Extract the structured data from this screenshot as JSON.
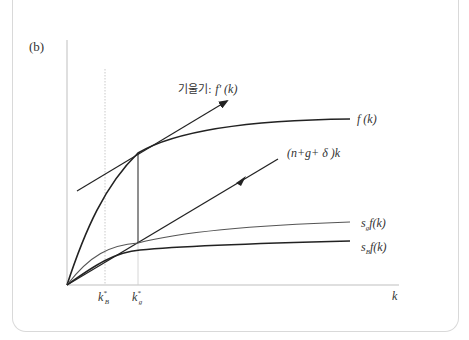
{
  "panel_label": "(b)",
  "labels": {
    "tangent": {
      "prefix": "기울기: ",
      "expr": "f' (k)"
    },
    "f": "f (k)",
    "depreciation_line": "(n+g+ δ )k",
    "sg_f": {
      "s": "s",
      "sub": "g",
      "rest": "f(k)"
    },
    "sB_f": {
      "s": "s",
      "sub": "B",
      "rest": "f(k)"
    },
    "kB_star": {
      "k": "k",
      "sup": "*",
      "sub": "B"
    },
    "kg_star": {
      "k": "k",
      "sup": "*",
      "sub": "g"
    },
    "x_axis": "k"
  },
  "colors": {
    "axis": "#bfbfbf",
    "curve": "#222222",
    "curve_light": "#555555",
    "guide": "#c8c8c8",
    "card_border": "#d9d9d9"
  }
}
